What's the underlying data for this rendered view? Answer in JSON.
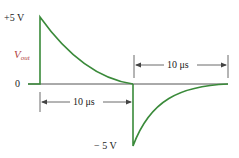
{
  "diagram": {
    "type": "waveform",
    "signal_label": "V",
    "signal_subscript": "out",
    "labels": {
      "plus": "+5 V",
      "zero": "0",
      "minus": "− 5 V"
    },
    "dimensions": {
      "lower": "10 μs",
      "upper": "10 μs"
    },
    "colors": {
      "waveform": "#3a8a3a",
      "axis": "#444444",
      "label": "#222222",
      "signal_label": "#b0413e"
    }
  }
}
